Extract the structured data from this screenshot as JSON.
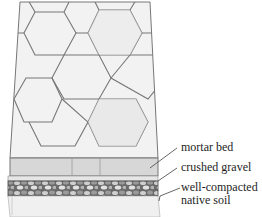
{
  "diagram": {
    "labels": [
      {
        "id": "mortar",
        "text": "mortar bed"
      },
      {
        "id": "gravel",
        "text": "crushed gravel"
      },
      {
        "id": "soil_1",
        "text": "well-compacted"
      },
      {
        "id": "soil_2",
        "text": "native soil"
      }
    ],
    "colors": {
      "line": "#555555",
      "paver_fill": "#f1f1f1",
      "slab_face": "#d6d6d6",
      "mortar": "#e4e4e4",
      "gravel_dark": "#5a5a5a",
      "gravel_light": "#c8c8c8",
      "soil": "#ececec"
    }
  }
}
